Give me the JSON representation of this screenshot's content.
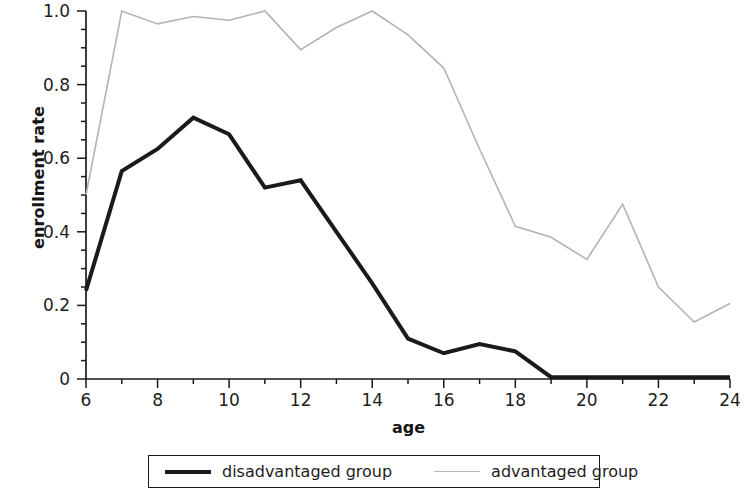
{
  "chart_data": {
    "type": "line",
    "title": "",
    "xlabel": "age",
    "ylabel": "enrollment rate",
    "x": [
      6,
      7,
      8,
      9,
      10,
      11,
      12,
      13,
      14,
      15,
      16,
      17,
      18,
      19,
      20,
      21,
      22,
      23,
      24
    ],
    "xlim": [
      6,
      24
    ],
    "ylim": [
      0,
      1.0
    ],
    "grid": false,
    "legend_position": "below-axes",
    "xticks": [
      "6",
      "8",
      "10",
      "12",
      "14",
      "16",
      "18",
      "20",
      "22",
      "24"
    ],
    "xtick_values": [
      6,
      8,
      10,
      12,
      14,
      16,
      18,
      20,
      22,
      24
    ],
    "xminor_step": 1,
    "yticks": [
      "0",
      "0.2",
      "0.4",
      "0.6",
      "0.8",
      "1.0"
    ],
    "ytick_values": [
      0,
      0.2,
      0.4,
      0.6,
      0.8,
      1.0
    ],
    "yminor_step": 0.05,
    "series": [
      {
        "name": "disadvantaged group",
        "color": "#1a1a1a",
        "width": 4,
        "values": [
          0.24,
          0.565,
          0.625,
          0.71,
          0.665,
          0.52,
          0.54,
          0.4,
          0.26,
          0.11,
          0.07,
          0.095,
          0.075,
          0.005,
          0.005,
          0.005,
          0.005,
          0.005,
          0.005
        ]
      },
      {
        "name": "advantaged group",
        "color": "#b4b4b4",
        "width": 1.6,
        "values": [
          0.5,
          1.0,
          0.965,
          0.985,
          0.975,
          1.0,
          0.895,
          0.955,
          1.0,
          0.935,
          0.845,
          0.625,
          0.415,
          0.385,
          0.325,
          0.475,
          0.25,
          0.155,
          0.205
        ]
      }
    ]
  },
  "legend": {
    "entries": [
      {
        "label": "disadvantaged group",
        "style": "thick"
      },
      {
        "label": "advantaged group",
        "style": "thin"
      }
    ]
  }
}
